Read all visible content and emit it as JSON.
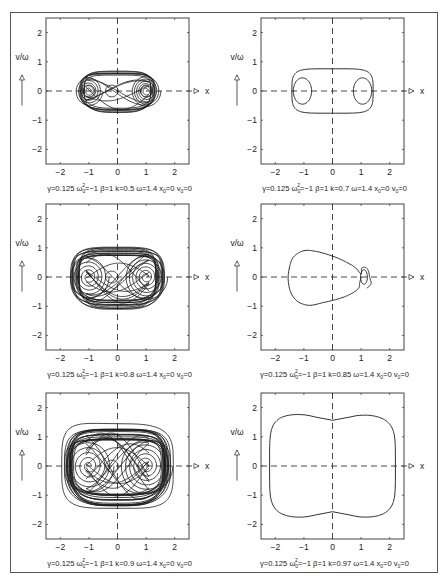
{
  "figure": {
    "frame": {
      "left": 10,
      "top": 12,
      "right": 438,
      "bottom": 573
    },
    "axis_labels": {
      "y": "v/ω",
      "x": "x"
    },
    "x_ticks": [
      "-2",
      "-1",
      "0",
      "1",
      "2"
    ],
    "y_ticks": [
      "2",
      "1",
      "0",
      "-1",
      "-2"
    ],
    "panels": [
      {
        "id": "k05",
        "col": 0,
        "row": 0,
        "caption": {
          "gamma": "γ=0.125",
          "omega0": "ω",
          "omega0_val": "=−1",
          "beta": "β=1",
          "k": "k=0.5",
          "omega": "ω=1.4",
          "x0": "x",
          "x0_val": "=0",
          "v0": "v",
          "v0_val": "=0"
        }
      },
      {
        "id": "k07",
        "col": 1,
        "row": 0,
        "caption": {
          "gamma": "γ=0.125",
          "omega0": "ω",
          "omega0_val": "=−1",
          "beta": "β=1",
          "k": "k=0.7",
          "omega": "ω=1.4",
          "x0": "x",
          "x0_val": "=0",
          "v0": "v",
          "v0_val": "=0"
        }
      },
      {
        "id": "k08",
        "col": 0,
        "row": 1,
        "caption": {
          "gamma": "γ=0.125",
          "omega0": "ω",
          "omega0_val": "=−1",
          "beta": "β=1",
          "k": "k=0.8",
          "omega": "ω=1.4",
          "x0": "x",
          "x0_val": "=0",
          "v0": "v",
          "v0_val": "=0"
        }
      },
      {
        "id": "k085",
        "col": 1,
        "row": 1,
        "caption": {
          "gamma": "γ=0.125",
          "omega0": "ω",
          "omega0_val": "=−1",
          "beta": "β=1",
          "k": "k=0.85",
          "omega": "ω=1.4",
          "x0": "x",
          "x0_val": "=0",
          "v0": "v",
          "v0_val": "=0"
        }
      },
      {
        "id": "k09",
        "col": 0,
        "row": 2,
        "caption": {
          "gamma": "γ=0.125",
          "omega0": "ω",
          "omega0_val": "=−1",
          "beta": "β=1",
          "k": "k=0.9",
          "omega": "ω=1.4",
          "x0": "x",
          "x0_val": "=0",
          "v0": "v",
          "v0_val": "=0"
        }
      },
      {
        "id": "k097",
        "col": 1,
        "row": 2,
        "caption": {
          "gamma": "γ=0.125",
          "omega0": "ω",
          "omega0_val": "=−1",
          "beta": "β=1",
          "k": "k=0.97",
          "omega": "ω=1.4",
          "x0": "x",
          "x0_val": "=0",
          "v0": "v",
          "v0_val": "=0"
        }
      }
    ]
  },
  "chart_data": [
    {
      "type": "line",
      "title": "Phase portrait (Duffing oscillator)",
      "xlabel": "x",
      "ylabel": "v/ω",
      "params": {
        "gamma": 0.125,
        "omega0_sq": -1,
        "beta": 1,
        "k": 0.5,
        "omega": 1.4,
        "x0": 0,
        "v0": 0
      },
      "xlim": [
        -2.5,
        2.5
      ],
      "ylim": [
        -2.5,
        2.5
      ],
      "x_ticks": [
        -2,
        -1,
        0,
        1,
        2
      ],
      "y_ticks": [
        -2,
        -1,
        0,
        1,
        2
      ],
      "behavior": "chaotic",
      "x_extent": [
        -1.5,
        1.5
      ],
      "v_extent": [
        -0.8,
        0.8
      ]
    },
    {
      "type": "line",
      "title": "Phase portrait (Duffing oscillator)",
      "xlabel": "x",
      "ylabel": "v/ω",
      "params": {
        "gamma": 0.125,
        "omega0_sq": -1,
        "beta": 1,
        "k": 0.7,
        "omega": 1.4,
        "x0": 0,
        "v0": 0
      },
      "xlim": [
        -2.5,
        2.5
      ],
      "ylim": [
        -2.5,
        2.5
      ],
      "x_ticks": [
        -2,
        -1,
        0,
        1,
        2
      ],
      "y_ticks": [
        -2,
        -1,
        0,
        1,
        2
      ],
      "behavior": "periodic (two-loop orbit)",
      "x_extent": [
        -1.45,
        1.45
      ],
      "v_extent": [
        -0.78,
        0.78
      ]
    },
    {
      "type": "line",
      "title": "Phase portrait (Duffing oscillator)",
      "xlabel": "x",
      "ylabel": "v/ω",
      "params": {
        "gamma": 0.125,
        "omega0_sq": -1,
        "beta": 1,
        "k": 0.8,
        "omega": 1.4,
        "x0": 0,
        "v0": 0
      },
      "xlim": [
        -2.5,
        2.5
      ],
      "ylim": [
        -2.5,
        2.5
      ],
      "x_ticks": [
        -2,
        -1,
        0,
        1,
        2
      ],
      "y_ticks": [
        -2,
        -1,
        0,
        1,
        2
      ],
      "behavior": "chaotic",
      "x_extent": [
        -1.7,
        1.7
      ],
      "v_extent": [
        -1.25,
        1.1
      ]
    },
    {
      "type": "line",
      "title": "Phase portrait (Duffing oscillator)",
      "xlabel": "x",
      "ylabel": "v/ω",
      "params": {
        "gamma": 0.125,
        "omega0_sq": -1,
        "beta": 1,
        "k": 0.85,
        "omega": 1.4,
        "x0": 0,
        "v0": 0
      },
      "xlim": [
        -2.5,
        2.5
      ],
      "ylim": [
        -2.5,
        2.5
      ],
      "x_ticks": [
        -2,
        -1,
        0,
        1,
        2
      ],
      "y_ticks": [
        -2,
        -1,
        0,
        1,
        2
      ],
      "behavior": "periodic (single loop with small inner loop near x=1.1)",
      "x_extent": [
        -1.55,
        1.45
      ],
      "v_extent": [
        -1.0,
        0.9
      ]
    },
    {
      "type": "line",
      "title": "Phase portrait (Duffing oscillator)",
      "xlabel": "x",
      "ylabel": "v/ω",
      "params": {
        "gamma": 0.125,
        "omega0_sq": -1,
        "beta": 1,
        "k": 0.9,
        "omega": 1.4,
        "x0": 0,
        "v0": 0
      },
      "xlim": [
        -2.5,
        2.5
      ],
      "ylim": [
        -2.5,
        2.5
      ],
      "x_ticks": [
        -2,
        -1,
        0,
        1,
        2
      ],
      "y_ticks": [
        -2,
        -1,
        0,
        1,
        2
      ],
      "behavior": "chaotic",
      "x_extent": [
        -1.8,
        1.95
      ],
      "v_extent": [
        -1.5,
        1.45
      ]
    },
    {
      "type": "line",
      "title": "Phase portrait (Duffing oscillator)",
      "xlabel": "x",
      "ylabel": "v/ω",
      "params": {
        "gamma": 0.125,
        "omega0_sq": -1,
        "beta": 1,
        "k": 0.97,
        "omega": 1.4,
        "x0": 0,
        "v0": 0
      },
      "xlim": [
        -2.5,
        2.5
      ],
      "ylim": [
        -2.5,
        2.5
      ],
      "x_ticks": [
        -2,
        -1,
        0,
        1,
        2
      ],
      "y_ticks": [
        -2,
        -1,
        0,
        1,
        2
      ],
      "behavior": "periodic (large single orbit)",
      "x_extent": [
        -2.2,
        2.2
      ],
      "v_extent": [
        -1.8,
        1.75
      ]
    }
  ]
}
